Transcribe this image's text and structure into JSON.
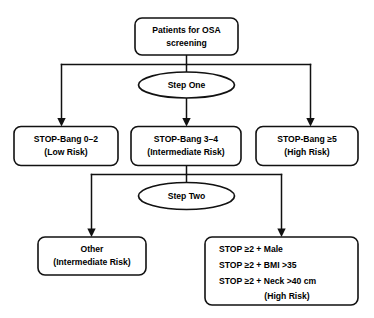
{
  "diagram": {
    "background_color": "#ffffff",
    "line_color": "#111111",
    "text_color": "#000000",
    "nodes": {
      "root": {
        "shape": "rounded-rect",
        "lines": [
          "Patients for OSA",
          "screening"
        ]
      },
      "step_one": {
        "shape": "ellipse",
        "label": "Step One"
      },
      "low_risk": {
        "shape": "rounded-rect",
        "lines": [
          "STOP-Bang 0–2",
          "(Low Risk)"
        ]
      },
      "intermediate_risk": {
        "shape": "rounded-rect",
        "lines": [
          "STOP-Bang 3–4",
          "(Intermediate Risk)"
        ]
      },
      "high_risk": {
        "shape": "rounded-rect",
        "lines": [
          "STOP-Bang ≥5",
          "(High Risk)"
        ]
      },
      "step_two": {
        "shape": "ellipse",
        "label": "Step Two"
      },
      "other": {
        "shape": "rounded-rect",
        "lines": [
          "Other",
          "(Intermediate Risk)"
        ]
      },
      "high_risk_criteria": {
        "shape": "rounded-rect",
        "lines": [
          "STOP ≥2 + Male",
          "STOP ≥2 + BMI >35",
          "STOP ≥2 + Neck >40 cm",
          "(High Risk)"
        ],
        "last_line_centered": true
      }
    }
  }
}
